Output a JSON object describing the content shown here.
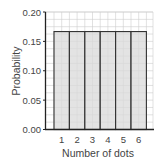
{
  "chart_data": {
    "type": "bar",
    "title": "",
    "xlabel": "Number of dots",
    "ylabel": "Probability",
    "categories": [
      "1",
      "2",
      "3",
      "4",
      "5",
      "6"
    ],
    "values": [
      0.1667,
      0.1667,
      0.1667,
      0.1667,
      0.1667,
      0.1667
    ],
    "ylim": [
      0,
      0.2
    ],
    "yticks": [
      "0.00",
      "0.05",
      "0.10",
      "0.15",
      "0.20"
    ],
    "grid": true,
    "legend": null,
    "colors": {
      "bar_fill": "#d9d9d9",
      "bar_edge": "#333333",
      "grid": "#cccccc",
      "axis": "#222222"
    }
  }
}
